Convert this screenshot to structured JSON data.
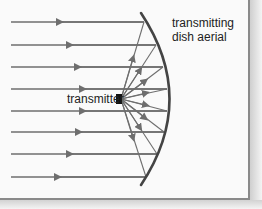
{
  "diagram": {
    "title": "Transmitting dish aerial",
    "labels": {
      "dish": [
        "transmitting",
        "dish aerial"
      ],
      "transmitter": "transmitter"
    },
    "colors": {
      "background": "#fafafa",
      "lines": "#6e6e6e",
      "dish": "#444444",
      "transmitter": "#111111",
      "text": "#222222"
    },
    "transmitter_position": [
      120,
      99
    ],
    "parallel_rays_y": [
      22,
      45,
      67,
      89,
      111,
      132,
      154,
      177
    ],
    "ray_direction": "left"
  }
}
